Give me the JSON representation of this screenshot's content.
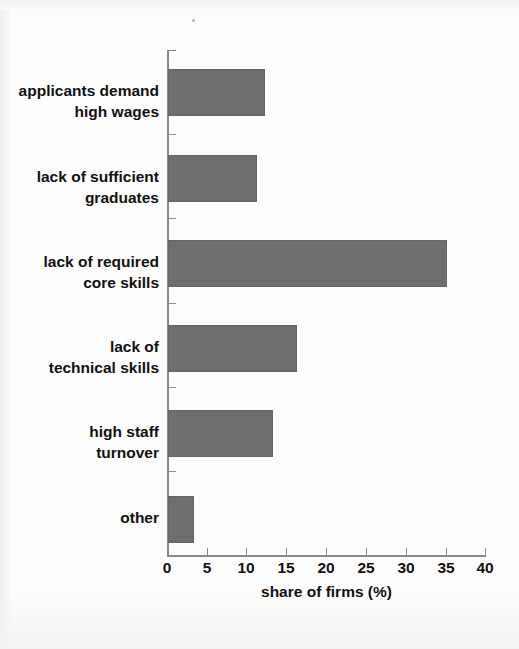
{
  "chart_data": {
    "type": "bar",
    "orientation": "horizontal",
    "title": "",
    "subtitle": "",
    "xlabel": "share of firms (%)",
    "ylabel": "",
    "categories": [
      "applicants demand high wages",
      "lack of sufficient graduates",
      "lack of required core skills",
      "lack of technical skills",
      "high staff turnover",
      "other"
    ],
    "category_lines": [
      [
        "applicants demand",
        "high wages"
      ],
      [
        "lack of sufficient",
        "graduates"
      ],
      [
        "lack of required",
        "core skills"
      ],
      [
        "lack of",
        "technical skills"
      ],
      [
        "high staff",
        "turnover"
      ],
      [
        "other"
      ]
    ],
    "values": [
      12,
      11,
      35,
      16,
      13,
      3
    ],
    "xlim": [
      0,
      40
    ],
    "xticks": [
      0,
      5,
      10,
      15,
      20,
      25,
      30,
      35,
      40
    ],
    "xtick_labels": [
      "0",
      "5",
      "10",
      "15",
      "20",
      "25",
      "30",
      "35",
      "40"
    ],
    "grid": false,
    "legend": false,
    "bar_color": "#6e6e6e",
    "axis_color": "#8a8a8a",
    "text_color": "#111111"
  }
}
